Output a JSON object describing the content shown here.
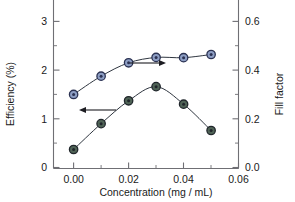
{
  "chart_data": {
    "type": "line",
    "title": "",
    "xlabel": "Concentration (mg / mL)",
    "ylabel": "Efficiency (%)",
    "y2label": "Fill factor",
    "xlim": [
      -0.004,
      0.063
    ],
    "ylim": [
      0,
      3.25
    ],
    "y2lim": [
      0.0,
      0.65
    ],
    "grid": false,
    "legend": "none",
    "x": [
      0.0,
      0.01,
      0.02,
      0.03,
      0.04,
      0.05
    ],
    "series": [
      {
        "name": "Efficiency (%)",
        "axis": "left",
        "marker": "circle",
        "color": "#4f6356",
        "edge_color": "#20262b",
        "values": [
          0.37,
          0.9,
          1.37,
          1.66,
          1.3,
          0.76
        ]
      },
      {
        "name": "Fill factor",
        "axis": "right",
        "marker": "circle",
        "color": "#8d9ec4",
        "edge_color": "#2b3252",
        "values": [
          0.3,
          0.375,
          0.43,
          0.452,
          0.451,
          0.464
        ]
      }
    ],
    "xticks": [
      0.0,
      0.02,
      0.04,
      0.06
    ],
    "xtick_labels": [
      "0.00",
      "0.02",
      "0.04",
      "0.06"
    ],
    "xticks_minor": [
      0.01,
      0.03,
      0.05
    ],
    "yticks": [
      0,
      1,
      2,
      3
    ],
    "ytick_labels": [
      "0",
      "1",
      "2",
      "3"
    ],
    "yticks_minor": [
      0.5,
      1.5,
      2.5
    ],
    "y2ticks": [
      0.0,
      0.2,
      0.4,
      0.6
    ],
    "y2tick_labels": [
      "0.0",
      "0.2",
      "0.4",
      "0.6"
    ],
    "y2ticks_minor": [
      0.1,
      0.3,
      0.5
    ],
    "annotations": [
      {
        "name": "arrow-to-right-axis",
        "direction": "right",
        "target_series": "Fill factor",
        "x1": 130,
        "y1": 63,
        "x2": 166,
        "y2": 63
      },
      {
        "name": "arrow-to-left-axis",
        "direction": "left",
        "target_series": "Efficiency (%)",
        "x1": 116,
        "y1": 110,
        "x2": 79,
        "y2": 110
      }
    ]
  },
  "axes": {
    "x_title": "Concentration (mg / mL)",
    "y_left_title": "Efficiency (%)",
    "y_right_title": "Fill factor",
    "x_tick_0": "0.00",
    "x_tick_1": "0.02",
    "x_tick_2": "0.04",
    "x_tick_3": "0.06",
    "y_tick_0": "0",
    "y_tick_1": "1",
    "y_tick_2": "2",
    "y_tick_3": "3",
    "y2_tick_0": "0.0",
    "y2_tick_1": "0.2",
    "y2_tick_2": "0.4",
    "y2_tick_3": "0.6"
  },
  "colors": {
    "efficiency_marker": "#4f6356",
    "fillfactor_marker": "#8d9ec4",
    "line": "#2f3640",
    "axis": "#6f6f74",
    "text": "#1a1a1a"
  }
}
